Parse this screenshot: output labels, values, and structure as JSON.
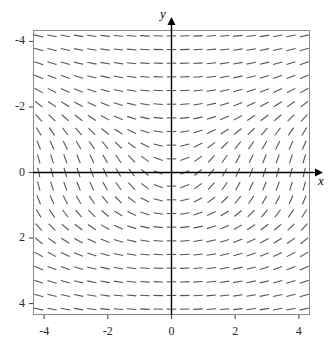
{
  "figure": {
    "kind": "slope-field",
    "background": "#ffffff",
    "frame_color": "#8a8a8a",
    "axis_color": "#000000",
    "dash_color": "#555555"
  },
  "axes": {
    "x_title": "x",
    "y_title": "y",
    "x_tick_labels": [
      "-4",
      "-2",
      "0",
      "2",
      "4"
    ],
    "y_tick_labels": [
      "4",
      "2",
      "0",
      "-2",
      "-4"
    ],
    "x_tick_values": [
      -4,
      -2,
      0,
      2,
      4
    ],
    "y_tick_values": [
      4,
      2,
      0,
      -2,
      -4
    ]
  },
  "chart_data": {
    "type": "line",
    "subtype": "slope-field",
    "title": "",
    "xlabel": "x",
    "ylabel": "y",
    "xlim": [
      -4.35,
      4.35
    ],
    "ylim": [
      -4.35,
      4.35
    ],
    "grid": false,
    "legend": null,
    "slope_formula": "dy/dx = x / (1 + y^2)",
    "sample_spacing": 0.42,
    "n_cols": 21,
    "n_rows": 21,
    "segment_length_px": 9.5,
    "x_ticks": [
      -4,
      -2,
      0,
      2,
      4
    ],
    "y_ticks": [
      -4,
      -2,
      0,
      2,
      4
    ],
    "annotations": [
      "Slopes are zero (horizontal) everywhere along the y-axis (x = 0).",
      "Slopes are negative for x < 0 and positive for x > 0.",
      "Steepness is greatest near y = 0 and decreases as |y| grows."
    ],
    "sample_slopes": [
      {
        "x": -4,
        "y": 0,
        "slope": -4
      },
      {
        "x": -4,
        "y": 4,
        "slope": -0.235
      },
      {
        "x": -2,
        "y": 0,
        "slope": -2
      },
      {
        "x": 0,
        "y": 0,
        "slope": 0
      },
      {
        "x": 0,
        "y": 4,
        "slope": 0
      },
      {
        "x": 2,
        "y": 0,
        "slope": 2
      },
      {
        "x": 4,
        "y": 0,
        "slope": 4
      },
      {
        "x": 4,
        "y": 4,
        "slope": 0.235
      },
      {
        "x": 4,
        "y": -4,
        "slope": 0.235
      },
      {
        "x": -4,
        "y": -4,
        "slope": -0.235
      }
    ]
  }
}
